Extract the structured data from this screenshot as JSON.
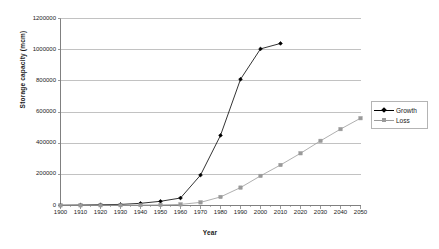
{
  "chart_data": {
    "type": "line",
    "title": "",
    "xlabel": "Year",
    "ylabel": "Storage capacity (mcm)",
    "x": [
      1900,
      1910,
      1920,
      1930,
      1940,
      1950,
      1960,
      1970,
      1980,
      1990,
      2000,
      2010,
      2020,
      2030,
      2040,
      2050
    ],
    "categories": [
      "1900",
      "1910",
      "1920",
      "1930",
      "1940",
      "1950",
      "1960",
      "1970",
      "1980",
      "1990",
      "2000",
      "2010",
      "2020",
      "2030",
      "2040",
      "2050"
    ],
    "xlim": [
      1900,
      2050
    ],
    "ylim": [
      0,
      1200000
    ],
    "yticks": [
      0,
      200000,
      400000,
      600000,
      800000,
      1000000,
      1200000
    ],
    "ytick_labels": [
      "0",
      "200000",
      "400000",
      "600000",
      "800000",
      "1000000",
      "1200000"
    ],
    "grid": "horizontal",
    "legend_position": "right-outside",
    "series": [
      {
        "name": "Growth",
        "color": "#000000",
        "marker": "diamond",
        "values": [
          2000,
          3000,
          5000,
          7000,
          14000,
          27000,
          48000,
          195000,
          450000,
          810000,
          1005000,
          1040000,
          null,
          null,
          null,
          null
        ]
      },
      {
        "name": "Loss",
        "color": "#9a9a9a",
        "marker": "square",
        "values": [
          500,
          800,
          1200,
          1800,
          2600,
          4000,
          7000,
          20000,
          55000,
          115000,
          190000,
          260000,
          335000,
          415000,
          490000,
          560000
        ]
      }
    ]
  },
  "axes": {
    "y_title": "Storage capacity (mcm)",
    "x_title": "Year"
  },
  "legend": {
    "items": [
      {
        "label": "Growth"
      },
      {
        "label": "Loss"
      }
    ]
  },
  "colors": {
    "growth": "#000000",
    "loss": "#9a9a9a",
    "gridline": "#a8a8a8",
    "axis": "#808080",
    "plot_background": "#ffffff"
  }
}
